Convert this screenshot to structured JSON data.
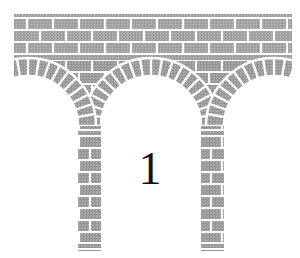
{
  "figure": {
    "kind": "line-art-illustration",
    "label": "1",
    "label_position": {
      "x": 150,
      "y": 172
    },
    "background_color": "#ffffff",
    "stone_fill_color": "#9a9a9a",
    "stone_fill_color_light": "#adadad",
    "mortar_color": "#ffffff",
    "outline_color": "#8e8e8e",
    "label_color": "#111111",
    "canvas": {
      "width": 300,
      "height": 258
    }
  },
  "structure": {
    "deck": {
      "name": "deck-wall",
      "left": 14,
      "right": 292,
      "top": 12,
      "bottom": 60,
      "courses": 4,
      "course_height": 12,
      "brick_width": 26
    },
    "archivolt": {
      "name": "arch-ring",
      "ring_thickness": 18,
      "voussoir_count_center": 21,
      "voussoir_count_side": 11
    },
    "center_arch": {
      "name": "center-arch",
      "center_x": 151,
      "springing_y": 126,
      "inner_radius": 50,
      "outer_radius": 68,
      "type": "semicircular"
    },
    "left_arch": {
      "name": "left-partial-arch",
      "center_x": 28,
      "springing_y": 126,
      "inner_radius": 50,
      "outer_radius": 68,
      "type": "partial-semicircular"
    },
    "right_arch": {
      "name": "right-partial-arch",
      "center_x": 274,
      "springing_y": 126,
      "inner_radius": 50,
      "outer_radius": 68,
      "type": "partial-semicircular"
    },
    "left_pier": {
      "name": "left-pier",
      "left": 58,
      "right": 101,
      "top": 126,
      "bottom": 250,
      "impost_y": 130,
      "impost_height": 5,
      "base_y": 243,
      "base_height": 6,
      "courses": 12
    },
    "right_pier": {
      "name": "right-pier",
      "left": 201,
      "right": 244,
      "top": 126,
      "bottom": 250,
      "impost_y": 130,
      "impost_height": 5,
      "base_y": 243,
      "base_height": 6,
      "courses": 12
    }
  },
  "label_style": {
    "font_size_px": 46,
    "weight": "normal"
  }
}
